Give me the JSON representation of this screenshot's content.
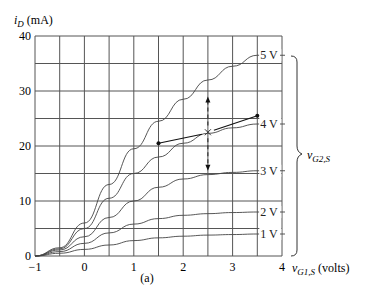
{
  "chart_data": {
    "type": "line",
    "title": "",
    "caption": "(a)",
    "xlabel": "v_G1,S (volts)",
    "ylabel": "i_D (mA)",
    "xlim": [
      -1,
      4
    ],
    "ylim": [
      0,
      40
    ],
    "x_ticks": [
      "-1",
      "0",
      "1",
      "2",
      "3",
      "4"
    ],
    "y_ticks": [
      "0",
      "10",
      "20",
      "30",
      "40"
    ],
    "grid": true,
    "grid_x_step": 0.5,
    "grid_y_step": 5,
    "family_label": "v_G2,S",
    "series": [
      {
        "name": "5 V",
        "x": [
          -1,
          -0.5,
          0,
          0.5,
          1,
          1.5,
          2,
          2.5,
          3,
          3.5
        ],
        "values": [
          0,
          1.5,
          6,
          13,
          19.5,
          24.5,
          28.5,
          32,
          34.5,
          36.5
        ]
      },
      {
        "name": "4 V",
        "x": [
          -1,
          -0.5,
          0,
          0.5,
          1,
          1.5,
          2,
          2.5,
          3,
          3.5
        ],
        "values": [
          0,
          1.3,
          5,
          10.5,
          15,
          18,
          20.5,
          22.3,
          23.3,
          24
        ]
      },
      {
        "name": "3 V",
        "x": [
          -1,
          -0.5,
          0,
          0.5,
          1,
          1.5,
          2,
          2.5,
          3,
          3.5
        ],
        "values": [
          0,
          1.1,
          3.5,
          7,
          10,
          12.5,
          14,
          14.8,
          15.2,
          15.5
        ]
      },
      {
        "name": "2 V",
        "x": [
          -1,
          -0.5,
          0,
          0.5,
          1,
          1.5,
          2,
          2.5,
          3,
          3.5
        ],
        "values": [
          0,
          0.8,
          2.3,
          4.2,
          5.8,
          6.8,
          7.4,
          7.7,
          7.9,
          8
        ]
      },
      {
        "name": "1 V",
        "x": [
          -1,
          -0.5,
          0,
          0.5,
          1,
          1.5,
          2,
          2.5,
          3,
          3.5
        ],
        "values": [
          0,
          0.5,
          1.2,
          2,
          2.8,
          3.3,
          3.6,
          3.8,
          3.9,
          4
        ]
      }
    ],
    "annotations": {
      "operating_point": {
        "x": 2.5,
        "y": 22.5,
        "marker": "x"
      },
      "segment": {
        "start": {
          "x": 1.5,
          "y": 20.5
        },
        "end": {
          "x": 3.5,
          "y": 25.5
        }
      },
      "vertical_arrow": {
        "x": 2.5,
        "y_top": 29,
        "y_bottom": 15.5,
        "style": "dashed, double-headed"
      }
    }
  },
  "labels": {
    "y_axis": "(mA)",
    "y_axis_symbol": "i",
    "y_axis_sub": "D",
    "x_axis_symbol": "v",
    "x_axis_sub": "G1,S",
    "x_axis_unit": "(volts)",
    "family_symbol": "v",
    "family_sub": "G2,S",
    "caption": "(a)",
    "curve_labels": [
      "5 V",
      "4 V",
      "3 V",
      "2 V",
      "1 V"
    ]
  }
}
